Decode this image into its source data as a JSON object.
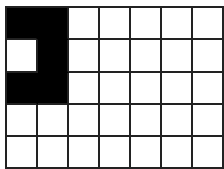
{
  "grid": {
    "rows": 5,
    "cols": 7,
    "filled_color": "#000000",
    "empty_color": "#ffffff",
    "line_color": "#222222",
    "cells": [
      [
        1,
        1,
        0,
        0,
        0,
        0,
        0
      ],
      [
        0,
        1,
        0,
        0,
        0,
        0,
        0
      ],
      [
        1,
        1,
        0,
        0,
        0,
        0,
        0
      ],
      [
        0,
        0,
        0,
        0,
        0,
        0,
        0
      ],
      [
        0,
        0,
        0,
        0,
        0,
        0,
        0
      ]
    ]
  }
}
